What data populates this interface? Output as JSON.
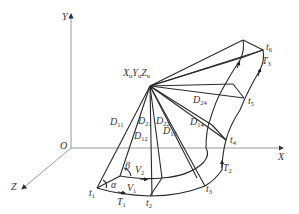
{
  "diagram": {
    "axes": {
      "x": {
        "label": "X"
      },
      "y": {
        "label": "Y"
      },
      "z": {
        "label": "Z"
      },
      "origin": {
        "label": "O"
      }
    },
    "apex": {
      "label": "X",
      "sub1": "u",
      "mid": "Y",
      "sub2": "u",
      "end": "Z",
      "sub3": "u"
    },
    "points": [
      {
        "id": "t1",
        "base": "t",
        "sub": "1"
      },
      {
        "id": "t2",
        "base": "t",
        "sub": "2"
      },
      {
        "id": "t3",
        "base": "t",
        "sub": "3"
      },
      {
        "id": "t4",
        "base": "t",
        "sub": "4"
      },
      {
        "id": "t5",
        "base": "t",
        "sub": "5"
      },
      {
        "id": "t6",
        "base": "t",
        "sub": "6"
      }
    ],
    "trajectories": [
      {
        "id": "T1",
        "base": "T",
        "sub": "1"
      },
      {
        "id": "T2",
        "base": "T",
        "sub": "2"
      },
      {
        "id": "T3",
        "base": "T",
        "sub": "3"
      }
    ],
    "velocities": [
      {
        "id": "V1",
        "base": "V",
        "sub": "1"
      },
      {
        "id": "V2",
        "base": "V",
        "sub": "2"
      }
    ],
    "distances": [
      {
        "id": "D11",
        "base": "D",
        "sub": "11"
      },
      {
        "id": "D21",
        "base": "D",
        "sub": "21"
      },
      {
        "id": "D12",
        "base": "D",
        "sub": "12"
      },
      {
        "id": "D22",
        "base": "D",
        "sub": "22"
      },
      {
        "id": "D13",
        "base": "D",
        "sub": "13"
      },
      {
        "id": "D14",
        "base": "D",
        "sub": "14"
      },
      {
        "id": "D24",
        "base": "D",
        "sub": "24"
      }
    ],
    "angles": {
      "alpha": "α",
      "beta": "β"
    }
  }
}
